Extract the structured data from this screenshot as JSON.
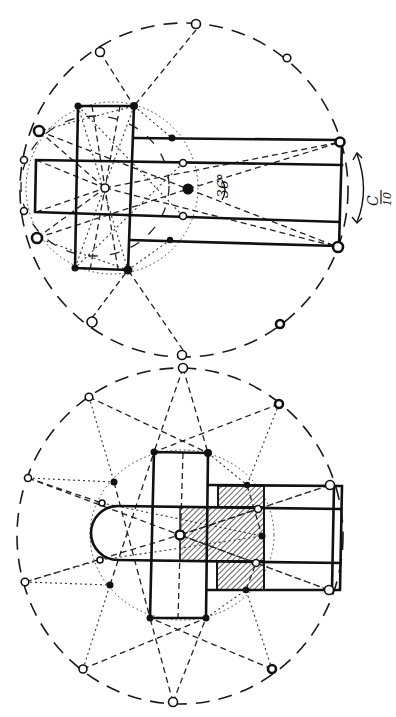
{
  "figure": {
    "upper": {
      "label": "upper-plan",
      "annotations": {
        "angle": "36°",
        "fraction_numerator": "C",
        "fraction_denominator": "10"
      }
    },
    "lower": {
      "label": "lower-plan"
    }
  },
  "colors": {
    "ink": "#111111",
    "paper": "#ffffff"
  }
}
